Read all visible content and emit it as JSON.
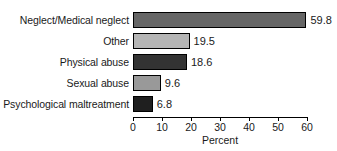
{
  "chart_data": {
    "type": "bar",
    "orientation": "horizontal",
    "title": "",
    "subtitle": "",
    "xlabel": "Percent",
    "ylabel": "",
    "categories": [
      "Neglect/Medical neglect",
      "Other",
      "Physical abuse",
      "Sexual abuse",
      "Psychological maltreatment"
    ],
    "values": [
      59.8,
      19.5,
      18.6,
      9.6,
      6.8
    ],
    "value_labels": [
      "59.8",
      "19.5",
      "18.6",
      "9.6",
      "6.8"
    ],
    "bar_colors": [
      "#666666",
      "#b5b5b5",
      "#333333",
      "#999999",
      "#1f1f1f"
    ],
    "bar_border_color": "#000000",
    "xlim": [
      0,
      60
    ],
    "xticks": [
      0,
      10,
      20,
      30,
      40,
      50,
      60
    ],
    "xtick_labels": [
      "0",
      "10",
      "20",
      "30",
      "40",
      "50",
      "60"
    ],
    "grid": false,
    "legend": null,
    "legend_position": "none",
    "annotations": []
  },
  "axis": {
    "title": "Percent",
    "line_color": "#000000"
  }
}
